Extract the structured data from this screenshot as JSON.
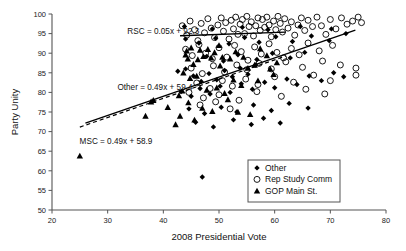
{
  "chart_data": {
    "type": "scatter",
    "title": "",
    "xlabel": "2008 Presidential Vote",
    "ylabel": "Party Unity",
    "xlim": [
      20,
      80
    ],
    "ylim": [
      50,
      100
    ],
    "xticks": [
      20,
      30,
      40,
      50,
      60,
      70,
      80
    ],
    "yticks": [
      50,
      55,
      60,
      65,
      70,
      75,
      80,
      85,
      90,
      95,
      100
    ],
    "grid": false,
    "legend_position": "lower-right",
    "legend": [
      {
        "name": "Other",
        "marker": "filled-diamond"
      },
      {
        "name": "Rep Study Comm",
        "marker": "open-circle"
      },
      {
        "name": "GOP Main St.",
        "marker": "filled-triangle"
      }
    ],
    "annotations": [
      {
        "text": "RSC = 0.05x + 92.3",
        "x": 40.0,
        "y": 95.0
      },
      {
        "text": "Other = 0.49x + 59.4",
        "x": 38.5,
        "y": 80.6
      },
      {
        "text": "MSC = 0.49x + 58.9",
        "x": 31.5,
        "y": 66.8
      }
    ],
    "fit_lines": [
      {
        "name": "RSC",
        "style": "solid",
        "slope": 0.05,
        "intercept": 92.3,
        "x_start": 43.0,
        "x_end": 62.0
      },
      {
        "name": "Other",
        "style": "solid",
        "slope": 0.49,
        "intercept": 59.4,
        "x_start": 26.0,
        "x_end": 74.5
      },
      {
        "name": "MSC",
        "style": "dashed",
        "slope": 0.49,
        "intercept": 58.9,
        "x_start": 25.0,
        "x_end": 62.0
      }
    ],
    "series": [
      {
        "name": "Rep Study Comm",
        "marker": "open-circle",
        "points": [
          [
            43.4,
            97.0
          ],
          [
            44.2,
            94.6
          ],
          [
            44.8,
            98.2
          ],
          [
            45.6,
            96.0
          ],
          [
            46.2,
            93.2
          ],
          [
            46.8,
            97.6
          ],
          [
            47.4,
            95.2
          ],
          [
            48.0,
            98.8
          ],
          [
            48.6,
            96.4
          ],
          [
            49.2,
            94.0
          ],
          [
            49.8,
            97.2
          ],
          [
            50.4,
            99.0
          ],
          [
            50.8,
            95.6
          ],
          [
            51.2,
            97.8
          ],
          [
            51.8,
            93.6
          ],
          [
            52.2,
            98.4
          ],
          [
            52.6,
            96.2
          ],
          [
            53.0,
            99.2
          ],
          [
            53.4,
            94.8
          ],
          [
            53.8,
            97.4
          ],
          [
            54.2,
            98.6
          ],
          [
            54.6,
            95.0
          ],
          [
            55.0,
            99.4
          ],
          [
            55.4,
            96.8
          ],
          [
            55.8,
            98.0
          ],
          [
            56.2,
            94.4
          ],
          [
            56.6,
            97.0
          ],
          [
            57.0,
            99.0
          ],
          [
            57.4,
            95.8
          ],
          [
            57.8,
            98.6
          ],
          [
            58.2,
            96.6
          ],
          [
            58.6,
            99.2
          ],
          [
            59.0,
            97.2
          ],
          [
            59.4,
            94.2
          ],
          [
            59.8,
            98.2
          ],
          [
            60.2,
            96.0
          ],
          [
            60.6,
            99.4
          ],
          [
            61.0,
            97.6
          ],
          [
            61.4,
            95.4
          ],
          [
            61.8,
            98.8
          ],
          [
            62.4,
            96.4
          ],
          [
            63.0,
            98.0
          ],
          [
            63.6,
            94.6
          ],
          [
            64.2,
            97.2
          ],
          [
            64.8,
            99.0
          ],
          [
            65.4,
            95.8
          ],
          [
            66.0,
            98.4
          ],
          [
            66.8,
            96.8
          ],
          [
            67.6,
            99.2
          ],
          [
            68.4,
            97.0
          ],
          [
            69.2,
            94.8
          ],
          [
            70.0,
            98.6
          ],
          [
            71.0,
            96.2
          ],
          [
            72.0,
            99.0
          ],
          [
            73.0,
            97.4
          ],
          [
            74.0,
            98.2
          ],
          [
            75.0,
            99.2
          ],
          [
            75.6,
            97.8
          ],
          [
            44.0,
            91.0
          ],
          [
            45.2,
            89.4
          ],
          [
            46.4,
            92.2
          ],
          [
            47.6,
            90.0
          ],
          [
            48.8,
            88.6
          ],
          [
            50.0,
            91.4
          ],
          [
            51.4,
            89.0
          ],
          [
            52.8,
            92.0
          ],
          [
            54.0,
            90.4
          ],
          [
            55.2,
            88.2
          ],
          [
            56.4,
            91.6
          ],
          [
            57.6,
            89.8
          ],
          [
            59.0,
            92.4
          ],
          [
            60.4,
            90.2
          ],
          [
            61.6,
            88.8
          ],
          [
            63.0,
            91.2
          ],
          [
            64.4,
            89.6
          ],
          [
            66.0,
            92.6
          ],
          [
            68.0,
            90.6
          ],
          [
            70.4,
            92.0
          ],
          [
            45.0,
            86.2
          ],
          [
            47.0,
            84.8
          ],
          [
            49.0,
            86.8
          ],
          [
            51.0,
            85.2
          ],
          [
            53.2,
            87.0
          ],
          [
            55.0,
            85.8
          ],
          [
            57.2,
            87.4
          ],
          [
            59.4,
            86.0
          ],
          [
            62.0,
            87.8
          ],
          [
            65.0,
            86.4
          ],
          [
            68.6,
            88.0
          ],
          [
            71.8,
            87.0
          ],
          [
            46.0,
            82.4
          ],
          [
            48.4,
            81.0
          ],
          [
            50.6,
            83.0
          ],
          [
            52.4,
            81.6
          ],
          [
            54.8,
            83.4
          ],
          [
            57.0,
            82.0
          ],
          [
            60.0,
            84.0
          ],
          [
            63.4,
            82.6
          ],
          [
            67.0,
            84.4
          ],
          [
            70.0,
            83.0
          ],
          [
            47.2,
            78.6
          ],
          [
            50.0,
            79.4
          ],
          [
            53.6,
            78.0
          ],
          [
            56.8,
            80.2
          ],
          [
            61.2,
            79.0
          ],
          [
            65.6,
            80.8
          ],
          [
            69.0,
            79.6
          ],
          [
            44.6,
            80.0
          ],
          [
            46.6,
            76.8
          ],
          [
            49.4,
            77.6
          ],
          [
            52.0,
            75.8
          ],
          [
            74.6,
            86.2
          ],
          [
            74.6,
            84.4
          ]
        ]
      },
      {
        "name": "GOP Main St.",
        "marker": "filled-triangle",
        "points": [
          [
            25.0,
            63.8
          ],
          [
            36.8,
            74.0
          ],
          [
            37.8,
            77.6
          ],
          [
            38.2,
            78.0
          ],
          [
            40.8,
            76.2
          ],
          [
            42.2,
            71.8
          ],
          [
            43.0,
            74.0
          ],
          [
            45.6,
            73.0
          ],
          [
            44.0,
            89.6
          ],
          [
            44.2,
            90.6
          ],
          [
            44.4,
            88.6
          ],
          [
            45.0,
            91.4
          ],
          [
            46.2,
            88.4
          ],
          [
            46.6,
            90.8
          ],
          [
            47.2,
            89.2
          ],
          [
            48.0,
            91.0
          ],
          [
            48.6,
            88.8
          ],
          [
            49.2,
            90.2
          ],
          [
            50.0,
            92.0
          ],
          [
            50.6,
            89.0
          ],
          [
            43.6,
            85.0
          ],
          [
            44.8,
            83.6
          ],
          [
            46.0,
            84.2
          ],
          [
            47.8,
            80.6
          ],
          [
            49.6,
            81.2
          ],
          [
            51.0,
            79.8
          ],
          [
            44.5,
            77.4
          ],
          [
            47.0,
            76.0
          ],
          [
            48.8,
            75.2
          ],
          [
            52.0,
            88.6
          ],
          [
            53.0,
            90.4
          ],
          [
            54.4,
            89.0
          ],
          [
            55.2,
            86.2
          ],
          [
            56.4,
            87.0
          ],
          [
            52.6,
            83.2
          ],
          [
            54.0,
            81.8
          ],
          [
            51.6,
            78.2
          ],
          [
            53.4,
            75.0
          ],
          [
            55.6,
            74.4
          ],
          [
            50.2,
            86.8
          ],
          [
            57.4,
            91.2
          ],
          [
            58.6,
            89.4
          ],
          [
            59.2,
            86.0
          ],
          [
            60.4,
            87.6
          ],
          [
            57.0,
            83.0
          ],
          [
            59.8,
            84.6
          ],
          [
            45.4,
            87.2
          ],
          [
            42.8,
            79.2
          ],
          [
            43.4,
            80.4
          ]
        ]
      },
      {
        "name": "Other",
        "marker": "filled-diamond",
        "points": [
          [
            47.0,
            58.4
          ],
          [
            42.6,
            85.4
          ],
          [
            44.0,
            86.0
          ],
          [
            45.4,
            84.2
          ],
          [
            46.8,
            82.8
          ],
          [
            48.2,
            84.8
          ],
          [
            49.6,
            83.2
          ],
          [
            51.0,
            85.6
          ],
          [
            52.4,
            84.0
          ],
          [
            53.8,
            86.2
          ],
          [
            55.2,
            84.6
          ],
          [
            56.6,
            87.0
          ],
          [
            43.2,
            80.2
          ],
          [
            45.0,
            79.0
          ],
          [
            46.6,
            81.0
          ],
          [
            48.4,
            79.6
          ],
          [
            50.2,
            81.6
          ],
          [
            52.0,
            80.0
          ],
          [
            54.0,
            82.2
          ],
          [
            56.0,
            80.8
          ],
          [
            58.2,
            82.6
          ],
          [
            60.0,
            81.2
          ],
          [
            62.2,
            83.4
          ],
          [
            64.0,
            82.0
          ],
          [
            66.2,
            84.2
          ],
          [
            68.4,
            83.0
          ],
          [
            70.6,
            85.0
          ],
          [
            72.4,
            84.0
          ],
          [
            44.6,
            75.8
          ],
          [
            47.4,
            74.6
          ],
          [
            50.4,
            76.2
          ],
          [
            53.2,
            75.0
          ],
          [
            56.2,
            76.8
          ],
          [
            59.4,
            75.4
          ],
          [
            62.6,
            77.2
          ],
          [
            66.0,
            76.0
          ],
          [
            45.8,
            72.4
          ],
          [
            49.0,
            71.2
          ],
          [
            52.6,
            73.0
          ],
          [
            55.8,
            71.8
          ],
          [
            58.0,
            73.4
          ],
          [
            61.0,
            72.2
          ],
          [
            44.0,
            93.6
          ],
          [
            46.4,
            92.6
          ],
          [
            49.4,
            93.8
          ],
          [
            51.8,
            92.4
          ],
          [
            54.6,
            94.0
          ],
          [
            57.2,
            92.8
          ],
          [
            60.2,
            94.2
          ],
          [
            63.2,
            93.0
          ],
          [
            66.6,
            94.4
          ],
          [
            69.8,
            93.2
          ],
          [
            72.8,
            95.0
          ],
          [
            47.8,
            89.2
          ],
          [
            50.8,
            88.0
          ],
          [
            53.4,
            89.6
          ],
          [
            56.8,
            88.4
          ],
          [
            59.6,
            90.0
          ],
          [
            62.8,
            88.8
          ],
          [
            65.4,
            90.2
          ],
          [
            43.8,
            96.8
          ],
          [
            48.8,
            96.2
          ],
          [
            54.2,
            96.6
          ],
          [
            58.8,
            96.0
          ],
          [
            64.6,
            96.8
          ],
          [
            70.2,
            96.2
          ]
        ]
      }
    ]
  }
}
